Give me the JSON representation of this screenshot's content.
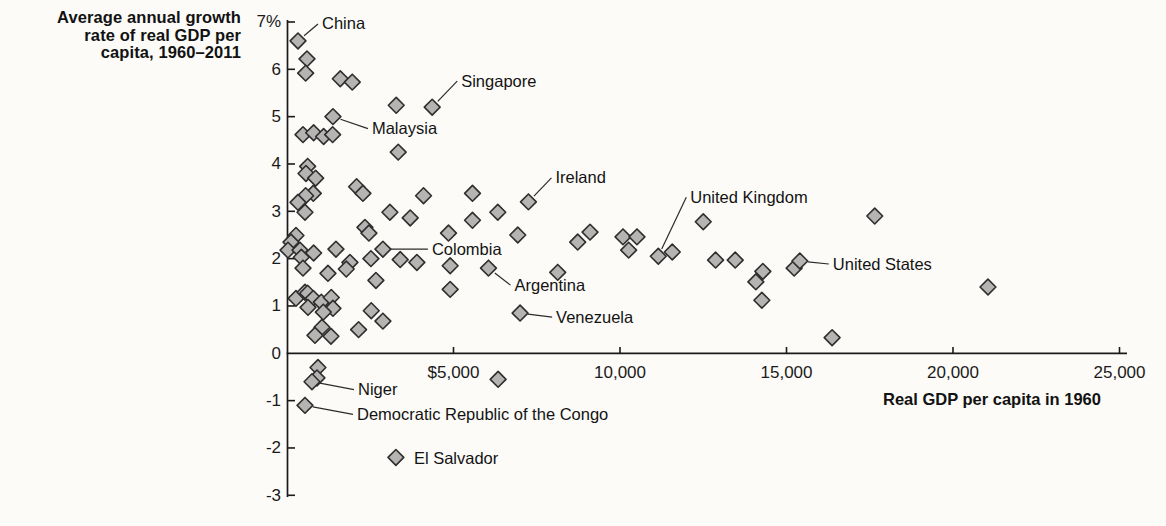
{
  "figure": {
    "y_axis_title_lines": [
      "Average annual growth",
      "rate of real GDP per",
      "capita, 1960–2011"
    ],
    "background_color": "#fcfbf8",
    "text_color": "#121212"
  },
  "chart_data": {
    "type": "scatter",
    "title": "",
    "xlabel": "Real GDP per capita in 1960",
    "ylabel": "Average annual growth rate of real GDP per capita, 1960–2011",
    "xlim": [
      0,
      25200
    ],
    "ylim": [
      -3,
      7
    ],
    "grid": false,
    "legend": "none",
    "marker": {
      "shape": "diamond",
      "fill": "#b5b4b2",
      "stroke": "#2e2e2e"
    },
    "axis_color": "#1a1a1a",
    "x_ticks": [
      {
        "value": 5000,
        "label": "$5,000"
      },
      {
        "value": 10000,
        "label": "10,000"
      },
      {
        "value": 15000,
        "label": "15,000"
      },
      {
        "value": 20000,
        "label": "20,000"
      },
      {
        "value": 25000,
        "label": "25,000"
      }
    ],
    "y_ticks": [
      {
        "value": 7,
        "label": "7%"
      },
      {
        "value": 6,
        "label": "6"
      },
      {
        "value": 5,
        "label": "5"
      },
      {
        "value": 4,
        "label": "4"
      },
      {
        "value": 3,
        "label": "3"
      },
      {
        "value": 2,
        "label": "2"
      },
      {
        "value": 1,
        "label": "1"
      },
      {
        "value": 0,
        "label": "0"
      },
      {
        "value": -1,
        "label": "-1"
      },
      {
        "value": -2,
        "label": "-2"
      },
      {
        "value": -3,
        "label": "-3"
      }
    ],
    "labeled_points": [
      {
        "label": "China",
        "x": 330,
        "y": 6.6,
        "offset": [
          24,
          -17
        ],
        "leader": true
      },
      {
        "label": "Singapore",
        "x": 4360,
        "y": 5.2,
        "offset": [
          29,
          -26
        ],
        "leader": true
      },
      {
        "label": "Malaysia",
        "x": 1380,
        "y": 5.0,
        "offset": [
          39,
          12
        ],
        "leader": true
      },
      {
        "label": "Ireland",
        "x": 7250,
        "y": 3.2,
        "offset": [
          27,
          -24
        ],
        "leader": true
      },
      {
        "label": "United Kingdom",
        "x": 11150,
        "y": 2.05,
        "offset": [
          32,
          -59
        ],
        "leader": true
      },
      {
        "label": "United States",
        "x": 15400,
        "y": 1.95,
        "offset": [
          33,
          3
        ],
        "leader": true
      },
      {
        "label": "Colombia",
        "x": 2880,
        "y": 2.2,
        "offset": [
          49,
          0
        ],
        "leader": true
      },
      {
        "label": "Argentina",
        "x": 6050,
        "y": 1.8,
        "offset": [
          26,
          17
        ],
        "leader": true
      },
      {
        "label": "Venezuela",
        "x": 7000,
        "y": 0.85,
        "offset": [
          36,
          4
        ],
        "leader": true
      },
      {
        "label": "Niger",
        "x": 750,
        "y": -0.6,
        "offset": [
          46,
          8
        ],
        "leader": true
      },
      {
        "label": "Democratic Republic of the Congo",
        "x": 540,
        "y": -1.1,
        "offset": [
          52,
          9
        ],
        "leader": true
      },
      {
        "label": "El Salvador",
        "x": 3270,
        "y": -2.2,
        "offset": [
          18,
          1
        ],
        "leader": false
      }
    ],
    "unlabeled_points": [
      [
        600,
        6.22
      ],
      [
        560,
        5.92
      ],
      [
        1600,
        5.8
      ],
      [
        1960,
        5.73
      ],
      [
        3280,
        5.24
      ],
      [
        480,
        4.62
      ],
      [
        800,
        4.66
      ],
      [
        1100,
        4.58
      ],
      [
        1370,
        4.62
      ],
      [
        3340,
        4.25
      ],
      [
        620,
        3.95
      ],
      [
        570,
        3.8
      ],
      [
        860,
        3.7
      ],
      [
        2090,
        3.52
      ],
      [
        2280,
        3.38
      ],
      [
        790,
        3.38
      ],
      [
        560,
        3.33
      ],
      [
        330,
        3.19
      ],
      [
        540,
        2.98
      ],
      [
        3090,
        2.98
      ],
      [
        3700,
        2.86
      ],
      [
        4100,
        3.33
      ],
      [
        5570,
        3.38
      ],
      [
        6330,
        2.98
      ],
      [
        5570,
        2.81
      ],
      [
        6930,
        2.5
      ],
      [
        4850,
        2.54
      ],
      [
        2340,
        2.66
      ],
      [
        2460,
        2.54
      ],
      [
        270,
        2.49
      ],
      [
        120,
        2.35
      ],
      [
        30,
        2.18
      ],
      [
        390,
        2.18
      ],
      [
        800,
        2.12
      ],
      [
        1470,
        2.2
      ],
      [
        430,
        2.03
      ],
      [
        1890,
        1.92
      ],
      [
        2520,
        2.0
      ],
      [
        3400,
        1.98
      ],
      [
        3900,
        1.92
      ],
      [
        480,
        1.8
      ],
      [
        1230,
        1.69
      ],
      [
        1780,
        1.78
      ],
      [
        2670,
        1.54
      ],
      [
        4900,
        1.85
      ],
      [
        4900,
        1.35
      ],
      [
        8130,
        1.71
      ],
      [
        8730,
        2.35
      ],
      [
        9100,
        2.56
      ],
      [
        10090,
        2.46
      ],
      [
        10510,
        2.46
      ],
      [
        10260,
        2.18
      ],
      [
        11570,
        2.14
      ],
      [
        12500,
        2.78
      ],
      [
        12870,
        1.97
      ],
      [
        13460,
        1.97
      ],
      [
        14080,
        1.51
      ],
      [
        14290,
        1.73
      ],
      [
        14260,
        1.12
      ],
      [
        15230,
        1.8
      ],
      [
        17650,
        2.9
      ],
      [
        21050,
        1.4
      ],
      [
        16370,
        0.33
      ],
      [
        270,
        1.16
      ],
      [
        540,
        1.29
      ],
      [
        620,
        1.27
      ],
      [
        790,
        1.16
      ],
      [
        1030,
        1.08
      ],
      [
        1330,
        1.18
      ],
      [
        630,
        0.97
      ],
      [
        1380,
        0.95
      ],
      [
        1090,
        0.87
      ],
      [
        2530,
        0.9
      ],
      [
        2880,
        0.68
      ],
      [
        1050,
        0.55
      ],
      [
        2150,
        0.5
      ],
      [
        840,
        0.38
      ],
      [
        1320,
        0.36
      ],
      [
        6340,
        -0.55
      ],
      [
        930,
        -0.3
      ],
      [
        900,
        -0.52
      ]
    ]
  }
}
